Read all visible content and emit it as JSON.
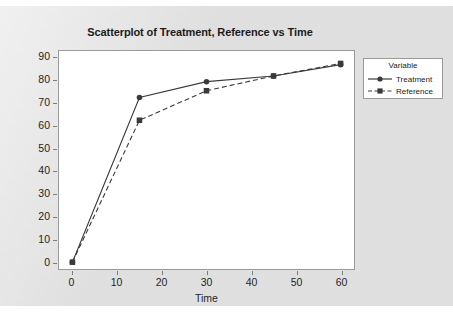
{
  "chart_data": {
    "type": "line",
    "title": "Scatterplot of Treatment, Reference vs Time",
    "xlabel": "Time",
    "ylabel": "Percent",
    "x": [
      0,
      15,
      30,
      45,
      60
    ],
    "series": [
      {
        "name": "Treatment",
        "values": [
          0,
          72.5,
          79.5,
          82,
          87
        ],
        "marker": "circle",
        "linestyle": "solid",
        "color": "#3a3a3a"
      },
      {
        "name": "Reference",
        "values": [
          0,
          62.5,
          75.5,
          82,
          87.5
        ],
        "marker": "square",
        "linestyle": "dashed",
        "color": "#3a3a3a"
      }
    ],
    "xlim": [
      -3,
      63
    ],
    "ylim": [
      -3,
      93
    ],
    "xticks": [
      0,
      10,
      20,
      30,
      40,
      50,
      60
    ],
    "yticks": [
      0,
      10,
      20,
      30,
      40,
      50,
      60,
      70,
      80,
      90
    ],
    "grid": false,
    "legend": {
      "title": "Variable",
      "position": "right-outside",
      "entries": [
        "Treatment",
        "Reference"
      ]
    }
  },
  "legend": {
    "title": "Variable",
    "items": [
      {
        "label": "Treatment",
        "marker": "circle",
        "style": "solid"
      },
      {
        "label": "Reference",
        "marker": "square",
        "style": "dashed"
      }
    ]
  },
  "colors": {
    "figure_background": "#e9e9e9",
    "plot_background": "#ffffff",
    "frame": "#9a9a9a",
    "data": "#3a3a3a",
    "text": "#1c1c1c"
  }
}
